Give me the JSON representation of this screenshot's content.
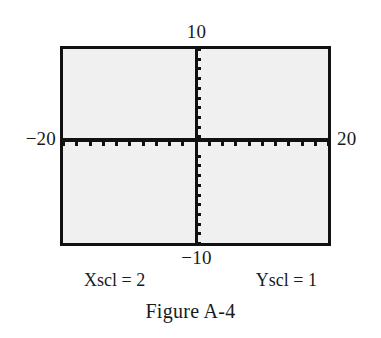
{
  "figure": {
    "caption": "Figure A-4",
    "axis_labels": {
      "y_max": "10",
      "y_min": "−10",
      "x_min": "−20",
      "x_max": "20"
    },
    "scale_notes": {
      "xscl": "Xscl = 2",
      "yscl": "Yscl = 1"
    },
    "colors": {
      "ink": "#111111",
      "screen_fill": "#f0f0f0",
      "page": "#ffffff"
    }
  },
  "chart_data": {
    "type": "line",
    "title": "Figure A-4",
    "subtitle": "",
    "xlabel": "",
    "ylabel": "",
    "xlim": [
      -20,
      20
    ],
    "ylim": [
      -10,
      10
    ],
    "xscl": 2,
    "yscl": 1,
    "grid": false,
    "legend": null,
    "series": [],
    "annotations": [
      "Xscl = 2",
      "Yscl = 1"
    ],
    "x_tick_values": [
      -20,
      -18,
      -16,
      -14,
      -12,
      -10,
      -8,
      -6,
      -4,
      -2,
      0,
      2,
      4,
      6,
      8,
      10,
      12,
      14,
      16,
      18,
      20
    ],
    "y_tick_values": [
      -10,
      -9,
      -8,
      -7,
      -6,
      -5,
      -4,
      -3,
      -2,
      -1,
      0,
      1,
      2,
      3,
      4,
      5,
      6,
      7,
      8,
      9,
      10
    ],
    "x_end_labels": [
      "−20",
      "20"
    ],
    "y_end_labels": [
      "−10",
      "10"
    ]
  }
}
